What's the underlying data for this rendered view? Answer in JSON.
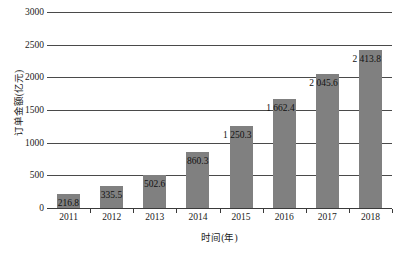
{
  "chart_data": {
    "type": "bar",
    "title": "",
    "xlabel": "时间(年)",
    "ylabel": "订单金额(亿元)",
    "categories": [
      "2011",
      "2012",
      "2013",
      "2014",
      "2015",
      "2016",
      "2017",
      "2018"
    ],
    "values": [
      216.8,
      335.5,
      502.6,
      860.3,
      1250.3,
      1662.4,
      2045.6,
      2413.8
    ],
    "value_labels": [
      "216.8",
      "335.5",
      "502.6",
      "860.3",
      "1 250.3",
      "1 662.4",
      "2 045.6",
      "2 413.8"
    ],
    "ylim": [
      0,
      3000
    ],
    "yticks": [
      0,
      500,
      1000,
      1500,
      2000,
      2500,
      3000
    ],
    "ytick_labels": [
      "0",
      "500",
      "1000",
      "1500",
      "2000",
      "2500",
      "3000"
    ],
    "grid": true,
    "legend": "none",
    "bar_color": "#808080",
    "gridline_color": "#4a4a4a",
    "background_color": "#ffffff",
    "series_name": "订单金额"
  }
}
